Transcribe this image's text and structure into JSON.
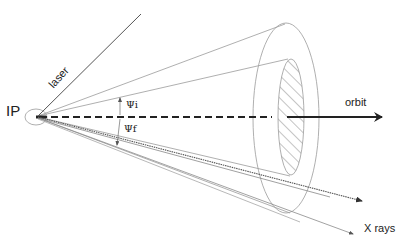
{
  "diagram": {
    "labels": {
      "ip": "IP",
      "laser": "laser",
      "orbit": "orbit",
      "xrays": "X rays",
      "psi_i": "Ψi",
      "psi_f": "Ψf"
    },
    "colors": {
      "line": "#555555",
      "light_line": "#9a9a9a",
      "axis": "#222222",
      "hatch": "#8a8a8a"
    }
  }
}
